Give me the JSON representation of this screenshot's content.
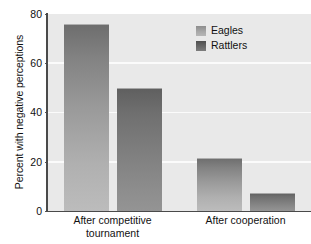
{
  "chart_data": {
    "type": "bar",
    "title": "",
    "subtitle": "",
    "xlabel": "",
    "ylabel": "Percent with negative perceptions",
    "ylim": [
      0,
      80
    ],
    "yticks": [
      0,
      20,
      40,
      60,
      80
    ],
    "ytick_labels": [
      "0",
      "20",
      "40",
      "60",
      "80"
    ],
    "grid": true,
    "grid_orientation": "horizontal",
    "legend_position": "top-right",
    "categories": [
      "After competitive tournament",
      "After cooperation"
    ],
    "category_lines": [
      [
        "After competitive",
        "tournament"
      ],
      [
        "After cooperation",
        ""
      ]
    ],
    "series": [
      {
        "name": "Eagles",
        "values": [
          76,
          21.5
        ],
        "color": "#9a9a9a"
      },
      {
        "name": "Rattlers",
        "values": [
          50,
          7.3
        ],
        "color": "#6f6f6f"
      }
    ],
    "bars": [
      {
        "series": "Eagles",
        "category": "After competitive tournament",
        "value": 76
      },
      {
        "series": "Rattlers",
        "category": "After competitive tournament",
        "value": 50
      },
      {
        "series": "Eagles",
        "category": "After cooperation",
        "value": 21.5
      },
      {
        "series": "Rattlers",
        "category": "After cooperation",
        "value": 7.3
      }
    ],
    "colors": {
      "plot_background": "#e9e9e9",
      "gridline": "#fbfbfb",
      "axis": "#4a4a4a",
      "eagles_top": "#6d6d6d",
      "eagles_bottom": "#bcbcbc",
      "rattlers_top": "#5f5f5f",
      "rattlers_bottom": "#949494",
      "text": "#111111"
    }
  },
  "axis": {
    "y_title": "Percent with negative perceptions",
    "y_tick_80": "80",
    "y_tick_60": "60",
    "y_tick_40": "40",
    "y_tick_20": "20",
    "y_tick_0": "0"
  },
  "x_categories": {
    "cat1_line1": "After competitive",
    "cat1_line2": "tournament",
    "cat2_line1": "After cooperation"
  },
  "legend": {
    "eagles_label": "Eagles",
    "rattlers_label": "Rattlers"
  }
}
